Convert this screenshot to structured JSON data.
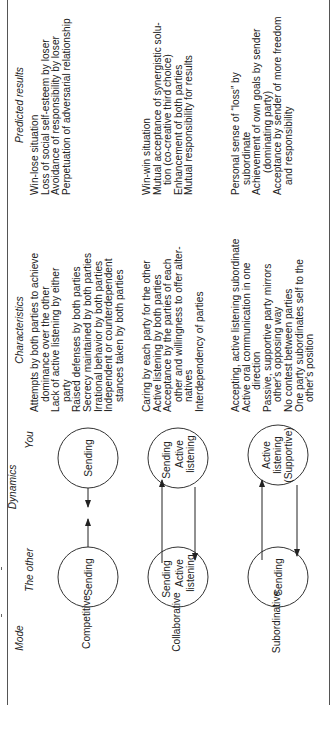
{
  "headers": {
    "mode": "Mode",
    "dynamics": "Dynamics",
    "the_other": "The other",
    "you": "You",
    "characteristics": "Characteristics",
    "predicted_results": "Predicted results"
  },
  "rows": [
    {
      "mode": "Competitive",
      "other_circle": [
        "Sending"
      ],
      "you_circle": [
        "Sending"
      ],
      "characteristics": [
        "Attempts by both parties to achieve",
        "dominance over the other",
        "Lack of active listening by either",
        "party",
        "Raised defenses by both parties",
        "Secrecy maintained by both parties",
        "Irrational behavior by both parties",
        "Independent or counterdependent",
        "stances taken by both parties"
      ],
      "results": [
        "Win-lose situation",
        "Loss of social self-esteem by loser",
        "Avoidance of responsibility by loser",
        "Perpetuation of adversarial relationship"
      ]
    },
    {
      "mode": "Collaborative",
      "other_circle": [
        "Sending",
        "Active",
        "listening"
      ],
      "you_circle": [
        "Sending",
        "Active",
        "listening"
      ],
      "characteristics": [
        "Caring by each party for the other",
        "Active listening by both parties",
        "Acceptance by the parties of each",
        "other and willingness to offer alter-",
        "natives",
        "Interdependency of parties"
      ],
      "results": [
        "Win-win situation",
        "Mutual acceptance of synergistic solu-",
        "tion (co-creative third choice)",
        "Enhancement of both parties",
        "Mutual responsibility for results"
      ]
    },
    {
      "mode": "Subordinative",
      "other_circle": [
        "Sending"
      ],
      "you_circle": [
        "Active",
        "listening",
        "(Supportive)"
      ],
      "characteristics": [
        "Accepting, active listening subordinate",
        "Active oral communication in one",
        "direction",
        "Passive, supportive party mirrors",
        "other's opposing way",
        "No contest between parties",
        "One party subordinates self to the",
        "other's position"
      ],
      "results": [
        "Personal sense of “loss” by",
        "subordinate",
        "Achievement of own goals by sender",
        "(dominating party)",
        "Acceptance by sender of more freedom",
        "and responsibility"
      ]
    }
  ],
  "colors": {
    "ink": "#222222",
    "rule": "#555555",
    "background": "#ffffff"
  }
}
